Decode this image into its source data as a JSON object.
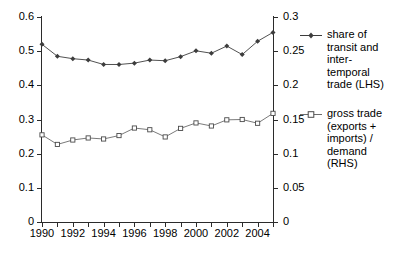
{
  "chart_data": {
    "type": "line",
    "title": "",
    "xlabel": "",
    "ylabel": "",
    "grid": false,
    "legend_position": "right",
    "x": [
      1990,
      1991,
      1992,
      1993,
      1994,
      1995,
      1996,
      1997,
      1998,
      1999,
      2000,
      2001,
      2002,
      2003,
      2004,
      2005
    ],
    "xlim": [
      1990,
      2005
    ],
    "x_tick_labels": [
      "1990",
      "1992",
      "1994",
      "1996",
      "1998",
      "2000",
      "2002",
      "2004"
    ],
    "x_tick_values": [
      1990,
      1992,
      1994,
      1996,
      1998,
      2000,
      2002,
      2004
    ],
    "left_axis": {
      "ylim": [
        0,
        0.6
      ],
      "tick_labels": [
        "0.6",
        "0.5",
        "0.4",
        "0.3",
        "0.2",
        "0.1",
        "0"
      ],
      "tick_values": [
        0.6,
        0.5,
        0.4,
        0.3,
        0.2,
        0.1,
        0
      ]
    },
    "right_axis": {
      "ylim": [
        0,
        0.3
      ],
      "tick_labels": [
        "0.3",
        "0.25",
        "0.2",
        "0.15",
        "0.1",
        "0.05",
        "0"
      ],
      "tick_values": [
        0.3,
        0.25,
        0.2,
        0.15,
        0.1,
        0.05,
        0
      ]
    },
    "series": [
      {
        "name": "share of transit and inter-temporal trade (LHS)",
        "axis": "left",
        "marker": "diamond",
        "color": "#3d3d3d",
        "values": [
          0.52,
          0.485,
          0.478,
          0.474,
          0.461,
          0.461,
          0.465,
          0.474,
          0.472,
          0.484,
          0.501,
          0.494,
          0.515,
          0.49,
          0.529,
          0.555
        ]
      },
      {
        "name": "gross trade (exports + imports) / demand (RHS)",
        "axis": "right",
        "marker": "open-square",
        "color": "#6b6b6b",
        "values": [
          0.1275,
          0.1135,
          0.12,
          0.123,
          0.1215,
          0.1265,
          0.1375,
          0.135,
          0.1245,
          0.137,
          0.145,
          0.1405,
          0.1495,
          0.15,
          0.1445,
          0.159
        ]
      }
    ]
  },
  "legend": {
    "entries": [
      {
        "marker": "diamond-line-marker",
        "label": "share of\ntransit and\ninter-\ntemporal\ntrade (LHS)"
      },
      {
        "marker": "open-square-line-marker",
        "label": "gross trade\n(exports +\nimports) /\ndemand\n(RHS)"
      }
    ]
  },
  "caption": {
    "text": ""
  }
}
